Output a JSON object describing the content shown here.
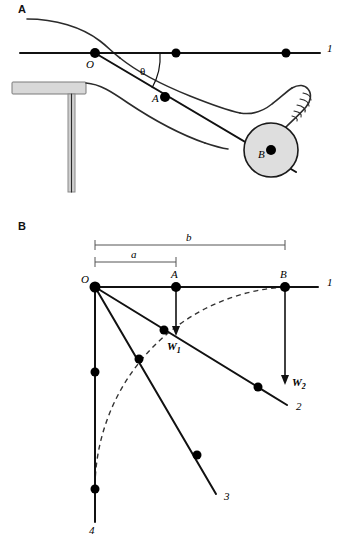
{
  "figure": {
    "background_color": "#ffffff",
    "stroke_color": "#111111",
    "ball_fill": "#dedede",
    "seat_fill": "#d8d8d8",
    "dashed_color": "#333333"
  },
  "panels": [
    {
      "id": "panel-a",
      "label": "A",
      "description": "Side view of a seated person with the leg extended, showing hip joint O, leg centre of mass A, ball B and horizontal reference line 1 with angle theta.",
      "points": [
        {
          "name": "O",
          "label": "O",
          "x": 95,
          "y": 53
        },
        {
          "name": "A",
          "label": "A",
          "x": 165,
          "y": 97
        },
        {
          "name": "B",
          "label": "B",
          "x": 271,
          "y": 150
        },
        {
          "name": "axis-dot-mid",
          "label": "",
          "x": 176,
          "y": 53
        },
        {
          "name": "axis-dot-right",
          "label": "",
          "x": 286,
          "y": 53
        }
      ],
      "angle": {
        "symbol": "θ",
        "label": "θ"
      },
      "ray_labels": [
        {
          "name": "line-1",
          "label": "1",
          "x": 327,
          "y": 52
        }
      ]
    },
    {
      "id": "panel-b",
      "label": "B",
      "description": "Schematic free-body diagram: rays 1 to 4 radiating from origin O, weights W1 and W2, and distances a and b.",
      "origin": {
        "name": "O",
        "label": "O",
        "x": 95,
        "y": 287
      },
      "dimensions": [
        {
          "name": "dimension-b",
          "label": "b",
          "from_x": 95,
          "to_x": 285,
          "y": 245,
          "text_x": 190,
          "text_y": 241
        },
        {
          "name": "dimension-a",
          "label": "a",
          "from_x": 95,
          "to_x": 176,
          "y": 262,
          "text_x": 135,
          "text_y": 258
        }
      ],
      "points": [
        {
          "name": "point-A",
          "label": "A",
          "x": 176,
          "y": 287,
          "label_x": 173,
          "label_y": 278
        },
        {
          "name": "point-B",
          "label": "B",
          "x": 285,
          "y": 287,
          "label_x": 282,
          "label_y": 278
        },
        {
          "name": "ray2-dot-inner",
          "label": "",
          "x": 164,
          "y": 330
        },
        {
          "name": "ray2-dot-outer",
          "label": "",
          "x": 258,
          "y": 387
        },
        {
          "name": "ray3-dot-inner",
          "label": "",
          "x": 139,
          "y": 359
        },
        {
          "name": "ray3-dot-outer",
          "label": "",
          "x": 197,
          "y": 455
        },
        {
          "name": "ray4-dot-inner",
          "label": "",
          "x": 95,
          "y": 372
        },
        {
          "name": "ray4-dot-outer",
          "label": "",
          "x": 95,
          "y": 489
        }
      ],
      "rays": [
        {
          "name": "ray-1",
          "label": "1",
          "end_x": 318,
          "end_y": 287,
          "label_x": 327,
          "label_y": 286
        },
        {
          "name": "ray-2",
          "label": "2",
          "end_x": 287,
          "end_y": 405,
          "label_x": 296,
          "label_y": 410
        },
        {
          "name": "ray-3",
          "label": "3",
          "end_x": 216,
          "end_y": 494,
          "label_x": 224,
          "label_y": 500
        },
        {
          "name": "ray-4",
          "label": "4",
          "end_x": 95,
          "end_y": 522,
          "label_x": 89,
          "label_y": 533
        }
      ],
      "forces": [
        {
          "name": "force-w1",
          "label": "W",
          "subscript": "1",
          "from_x": 176,
          "from_y": 287,
          "to_x": 176,
          "to_y": 334,
          "label_x": 171,
          "label_y": 348
        },
        {
          "name": "force-w2",
          "label": "W",
          "subscript": "2",
          "from_x": 285,
          "from_y": 287,
          "to_x": 285,
          "to_y": 384,
          "label_x": 293,
          "label_y": 386
        }
      ],
      "arc": {
        "name": "trajectory-arc",
        "style": "dashed",
        "radius": 202
      }
    }
  ]
}
